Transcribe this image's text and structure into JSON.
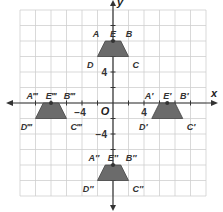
{
  "diagram": {
    "type": "coordinate-plane-translations",
    "axes": {
      "x_label": "x",
      "y_label": "y",
      "origin_label": "O",
      "range": [
        -12,
        12
      ],
      "grid_step": 2
    },
    "tick_labels": [
      {
        "text": "4",
        "axis": "x",
        "value": 4
      },
      {
        "text": "−4",
        "axis": "x",
        "value": -4
      },
      {
        "text": "4",
        "axis": "y",
        "value": 4
      },
      {
        "text": "−4",
        "axis": "y",
        "value": -4
      }
    ],
    "colors": {
      "grid": "#cfcfcf",
      "axis": "#333333",
      "shape_fill": "#6b6b6b",
      "shape_stroke": "#444444"
    },
    "figures": [
      {
        "name": "ABCD",
        "points": {
          "A": [
            -1,
            8
          ],
          "B": [
            1,
            8
          ],
          "C": [
            2,
            6
          ],
          "D": [
            -2,
            6
          ],
          "E": [
            0,
            8
          ]
        },
        "labels": {
          "A": "A",
          "B": "B",
          "C": "C",
          "D": "D",
          "E": "E"
        }
      },
      {
        "name": "A'B'C'D'",
        "points": {
          "A": [
            6,
            0
          ],
          "B": [
            8,
            0
          ],
          "C": [
            9,
            -2
          ],
          "D": [
            5,
            -2
          ],
          "E": [
            7,
            0
          ]
        },
        "labels": {
          "A": "A′",
          "B": "B′",
          "C": "C′",
          "D": "D′",
          "E": "E′"
        }
      },
      {
        "name": "A''B''C''D''",
        "points": {
          "A": [
            -1,
            -8
          ],
          "B": [
            1,
            -8
          ],
          "C": [
            2,
            -10
          ],
          "D": [
            -2,
            -10
          ],
          "E": [
            0,
            -8
          ]
        },
        "labels": {
          "A": "A″",
          "B": "B″",
          "C": "C″",
          "D": "D″",
          "E": "E″"
        }
      },
      {
        "name": "A'''B'''C'''D'''",
        "points": {
          "A": [
            -9,
            0
          ],
          "B": [
            -7,
            0
          ],
          "C": [
            -6,
            -2
          ],
          "D": [
            -10,
            -2
          ],
          "E": [
            -8,
            0
          ]
        },
        "labels": {
          "A": "A‴",
          "B": "B‴",
          "C": "C‴",
          "D": "D‴",
          "E": "E‴"
        }
      }
    ]
  }
}
